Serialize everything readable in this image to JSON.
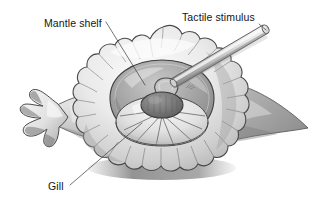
{
  "figure": {
    "background_color": "#ffffff",
    "style": "greyscale shaded line illustration",
    "labels": [
      {
        "id": "mantle-shelf",
        "text": "Mantle shelf",
        "text_x": 44,
        "text_y": 27,
        "leader": {
          "x1": 106,
          "y1": 22,
          "x2": 145,
          "y2": 85
        }
      },
      {
        "id": "tactile-stimulus",
        "text": "Tactile stimulus",
        "text_x": 182,
        "text_y": 21,
        "leader": {
          "x1": 258,
          "y1": 24,
          "x2": 268,
          "y2": 32
        }
      },
      {
        "id": "gill",
        "text": "Gill",
        "text_x": 48,
        "text_y": 190,
        "leader": {
          "x1": 70,
          "y1": 185,
          "x2": 142,
          "y2": 123
        }
      }
    ],
    "colors": {
      "ink": "#2e2e2e",
      "outline": "#4a4a4a",
      "body_light": "#f2f2f2",
      "body_mid": "#d4d4d4",
      "body_shadow": "#a8a8a8",
      "deep_shadow": "#8a8a8a",
      "tail_dark": "#9a9a9a",
      "cavity_dark": "#7e7e7e",
      "siphon_dark": "#6e6e6e",
      "probe_light": "#ededed",
      "probe_mid": "#bdbdbd",
      "probe_dark": "#8f8f8f",
      "label_text": "#141414",
      "leader_line": "#3a3a3a"
    },
    "structures": [
      {
        "id": "mantle-shelf-frill",
        "name": "mantle shelf",
        "description": "scalloped frilled mantle collar surrounding the gill cavity"
      },
      {
        "id": "gill",
        "name": "gill",
        "description": "radiating gill leaflets fanning from a central mass"
      },
      {
        "id": "siphon-mass",
        "name": "central siphon mass",
        "description": "dark oval body with curved tube above"
      },
      {
        "id": "head-tentacles",
        "name": "head tentacles",
        "description": "finger-like projections at the left end"
      },
      {
        "id": "tail",
        "name": "tail",
        "description": "dark grey tapering tail at the right"
      },
      {
        "id": "tactile-probe",
        "name": "tactile stimulus probe",
        "description": "cylindrical rod contacting the mantle shelf from upper right"
      }
    ]
  }
}
